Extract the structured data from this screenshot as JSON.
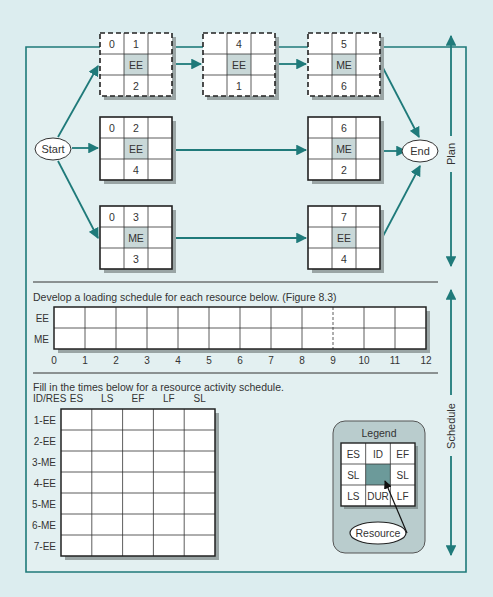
{
  "colors": {
    "background": "#dcedef",
    "panel": "#e6f2f3",
    "teal": "#1f7a7a",
    "resource_cell": "#c9d8d8",
    "legend_resource_cell": "#6c9a9a",
    "legend_bg": "#b9cccd",
    "shadow": "#9aa5a5"
  },
  "network": {
    "start_label": "Start",
    "end_label": "End",
    "nodes": [
      {
        "id": "1",
        "es": "0",
        "resource": "EE",
        "dur": "2",
        "dashed": true
      },
      {
        "id": "2",
        "es": "0",
        "resource": "EE",
        "dur": "4",
        "dashed": false
      },
      {
        "id": "3",
        "es": "0",
        "resource": "ME",
        "dur": "3",
        "dashed": false
      },
      {
        "id": "4",
        "es": "",
        "resource": "EE",
        "dur": "1",
        "dashed": true
      },
      {
        "id": "5",
        "es": "",
        "resource": "ME",
        "dur": "6",
        "dashed": true
      },
      {
        "id": "6",
        "es": "",
        "resource": "ME",
        "dur": "2",
        "dashed": false
      },
      {
        "id": "7",
        "es": "",
        "resource": "EE",
        "dur": "4",
        "dashed": false
      }
    ]
  },
  "side_labels": {
    "plan": "Plan",
    "schedule": "Schedule"
  },
  "loading_schedule": {
    "instruction": "Develop a loading schedule for each resource below. (Figure 8.3)",
    "rows": [
      "EE",
      "ME"
    ],
    "ticks": [
      "0",
      "1",
      "2",
      "3",
      "4",
      "5",
      "6",
      "7",
      "8",
      "9",
      "10",
      "11",
      "12"
    ],
    "dashed_at": "9"
  },
  "activity_schedule": {
    "instruction": "Fill in the times below for a resource activity schedule.",
    "header": [
      "ID/RES",
      "ES",
      "LS",
      "EF",
      "LF",
      "SL"
    ],
    "rows": [
      "1-EE",
      "2-EE",
      "3-ME",
      "4-EE",
      "5-ME",
      "6-ME",
      "7-EE"
    ]
  },
  "legend": {
    "title": "Legend",
    "cells": [
      "ES",
      "ID",
      "EF",
      "SL",
      "",
      "SL",
      "LS",
      "DUR",
      "LF"
    ],
    "resource_label": "Resource"
  }
}
